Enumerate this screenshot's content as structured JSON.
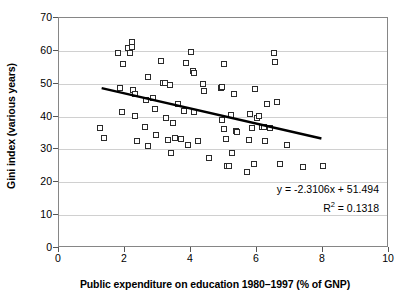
{
  "chart_data": {
    "type": "scatter",
    "title": "",
    "xlabel": "Public expenditure on education 1980–1997 (% of GNP)",
    "ylabel": "Gini index (various years)",
    "xlim": [
      0,
      10
    ],
    "ylim": [
      0,
      70
    ],
    "xticks": [
      0,
      2,
      4,
      6,
      8,
      10
    ],
    "yticks": [
      0,
      10,
      20,
      30,
      40,
      50,
      60,
      70
    ],
    "grid": "horizontal",
    "legend": "none",
    "marker": "open-square",
    "marker_color": "#2b2b2b",
    "series": [
      {
        "name": "countries",
        "points": [
          [
            1.25,
            36.6
          ],
          [
            1.35,
            33.6
          ],
          [
            1.8,
            59.5
          ],
          [
            1.85,
            48.7
          ],
          [
            1.9,
            41.3
          ],
          [
            1.95,
            56.0
          ],
          [
            2.1,
            61.0
          ],
          [
            2.15,
            59.2
          ],
          [
            2.2,
            62.6
          ],
          [
            2.2,
            61.3
          ],
          [
            2.25,
            48.2
          ],
          [
            2.3,
            46.8
          ],
          [
            2.3,
            40.2
          ],
          [
            2.35,
            32.7
          ],
          [
            2.6,
            36.8
          ],
          [
            2.65,
            45.0
          ],
          [
            2.7,
            52.0
          ],
          [
            2.7,
            31.0
          ],
          [
            2.85,
            45.8
          ],
          [
            2.9,
            42.2
          ],
          [
            2.95,
            34.4
          ],
          [
            3.1,
            57.0
          ],
          [
            3.15,
            50.3
          ],
          [
            3.2,
            50.3
          ],
          [
            3.25,
            39.7
          ],
          [
            3.3,
            32.8
          ],
          [
            3.35,
            49.6
          ],
          [
            3.4,
            28.9
          ],
          [
            3.45,
            37.9
          ],
          [
            3.5,
            33.4
          ],
          [
            3.6,
            43.8
          ],
          [
            3.7,
            33.2
          ],
          [
            3.8,
            41.6
          ],
          [
            3.85,
            56.3
          ],
          [
            3.9,
            31.5
          ],
          [
            4.0,
            59.8
          ],
          [
            4.05,
            54.0
          ],
          [
            4.1,
            53.4
          ],
          [
            4.1,
            41.3
          ],
          [
            4.2,
            32.6
          ],
          [
            4.35,
            50.0
          ],
          [
            4.4,
            47.8
          ],
          [
            4.55,
            27.4
          ],
          [
            4.9,
            48.7
          ],
          [
            4.95,
            48.9
          ],
          [
            4.95,
            39.1
          ],
          [
            5.0,
            56.0
          ],
          [
            5.0,
            36.1
          ],
          [
            5.05,
            33.2
          ],
          [
            5.1,
            25.0
          ],
          [
            5.15,
            24.9
          ],
          [
            5.2,
            40.5
          ],
          [
            5.25,
            28.9
          ],
          [
            5.3,
            47.0
          ],
          [
            5.35,
            35.6
          ],
          [
            5.4,
            35.2
          ],
          [
            5.7,
            23.1
          ],
          [
            5.75,
            32.8
          ],
          [
            5.8,
            40.7
          ],
          [
            5.85,
            36.5
          ],
          [
            5.9,
            25.5
          ],
          [
            5.95,
            48.5
          ],
          [
            6.0,
            39.6
          ],
          [
            6.05,
            40.1
          ],
          [
            6.15,
            36.7
          ],
          [
            6.2,
            36.9
          ],
          [
            6.25,
            32.6
          ],
          [
            6.3,
            43.8
          ],
          [
            6.4,
            36.5
          ],
          [
            6.5,
            59.3
          ],
          [
            6.55,
            56.7
          ],
          [
            6.6,
            44.3
          ],
          [
            6.7,
            25.7
          ],
          [
            6.9,
            31.4
          ],
          [
            7.4,
            24.8
          ],
          [
            8.0,
            25.1
          ]
        ]
      }
    ],
    "trendline": {
      "equation": "y = -2.3106x + 51.494",
      "r_squared_label": "R",
      "r_squared_sup": "2",
      "r_squared_value": " = 0.1318",
      "slope": -2.3106,
      "intercept": 51.494,
      "r_squared": 0.1318,
      "x_start": 1.3,
      "x_end": 8.0,
      "color": "#000000"
    }
  }
}
